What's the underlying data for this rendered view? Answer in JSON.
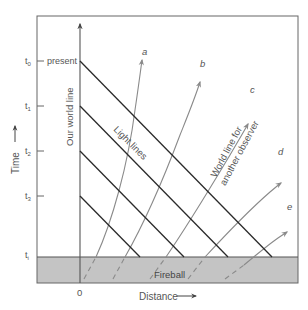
{
  "figure": {
    "type": "spacetime-diagram"
  },
  "axes": {
    "y_label": "Time",
    "x_label": "Distance",
    "origin_label": "0",
    "our_world_line_label": "Our world line"
  },
  "time_ticks": [
    {
      "label": "t",
      "sub": "0",
      "y": 61,
      "note": "present"
    },
    {
      "label": "t",
      "sub": "1",
      "y": 106,
      "note": ""
    },
    {
      "label": "t",
      "sub": "2",
      "y": 151,
      "note": ""
    },
    {
      "label": "t",
      "sub": "3",
      "y": 196,
      "note": ""
    },
    {
      "label": "t",
      "sub": "i",
      "y": 257,
      "note": ""
    }
  ],
  "labels": {
    "present": "present",
    "light_lines": "Light lines",
    "other_world_line_1": "World line for",
    "other_world_line_2": "another observer",
    "fireball": "Fireball"
  },
  "world_lines": [
    {
      "name": "a",
      "label": "a"
    },
    {
      "name": "b",
      "label": "b"
    },
    {
      "name": "c",
      "label": "c"
    },
    {
      "name": "d",
      "label": "d"
    },
    {
      "name": "e",
      "label": "e"
    }
  ],
  "colors": {
    "frame": "#555555",
    "light_line": "#2a2a2a",
    "world_line": "#8a8a8a",
    "fireball_fill": "#c4c4c4",
    "text": "#555555"
  }
}
